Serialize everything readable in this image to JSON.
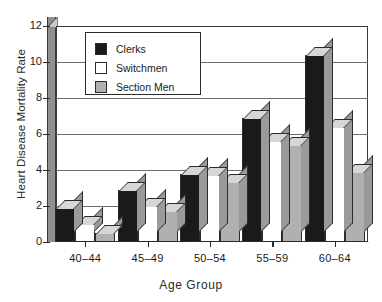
{
  "chart_data": {
    "type": "bar",
    "title": "",
    "xlabel": "Age Group",
    "ylabel": "Heart Disease Mortality Rate",
    "categories": [
      "40–44",
      "45–49",
      "50–54",
      "55–59",
      "60–64"
    ],
    "series": [
      {
        "name": "Clerks",
        "color": "#1a1a1a",
        "values": [
          1.9,
          2.9,
          3.8,
          6.9,
          10.4
        ]
      },
      {
        "name": "Switchmen",
        "color": "#ffffff",
        "values": [
          1.0,
          2.0,
          3.7,
          5.6,
          6.4
        ]
      },
      {
        "name": "Section Men",
        "color": "#b0b0b0",
        "values": [
          0.5,
          1.7,
          3.35,
          5.4,
          3.9
        ]
      }
    ],
    "ylim": [
      0,
      12
    ],
    "yticks": [
      0,
      2,
      4,
      6,
      8,
      10,
      12
    ],
    "ytick_labels": [
      "0",
      "2",
      "4",
      "6",
      "8",
      "10",
      "12"
    ],
    "grid": true,
    "legend_position": "upper-left",
    "style": "3d-bar"
  },
  "axis": {
    "y_title": "Heart Disease Mortality Rate",
    "x_title": "Age Group"
  }
}
